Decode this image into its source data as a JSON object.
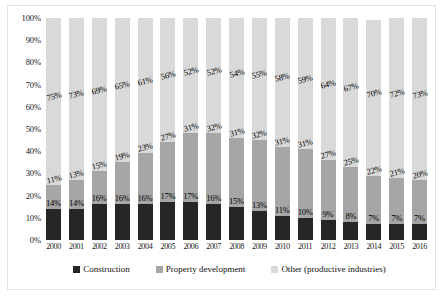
{
  "chart_data": {
    "type": "bar",
    "stacked": true,
    "title": "",
    "xlabel": "",
    "ylabel": "",
    "ylim": [
      0,
      100
    ],
    "grid": false,
    "legend_position": "bottom",
    "categories": [
      "2000",
      "2001",
      "2002",
      "2003",
      "2004",
      "2005",
      "2006",
      "2007",
      "2008",
      "2009",
      "2010",
      "2011",
      "2012",
      "2013",
      "2014",
      "2015",
      "2016"
    ],
    "ytick_labels": [
      "100%",
      "90%",
      "80%",
      "70%",
      "60%",
      "50%",
      "40%",
      "30%",
      "20%",
      "10%",
      "0%"
    ],
    "ytick_values": [
      100,
      90,
      80,
      70,
      60,
      50,
      40,
      30,
      20,
      10,
      0
    ],
    "series": [
      {
        "name": "Construction",
        "color": "#262626",
        "values": [
          14,
          14,
          16,
          16,
          16,
          17,
          17,
          16,
          15,
          13,
          11,
          10,
          9,
          8,
          7,
          7,
          7
        ],
        "labels": [
          "14%",
          "14%",
          "16%",
          "16%",
          "16%",
          "17%",
          "17%",
          "16%",
          "15%",
          "13%",
          "11%",
          "10%",
          "9%",
          "8%",
          "7%",
          "7%",
          "7%"
        ]
      },
      {
        "name": "Property development",
        "color": "#a6a6a6",
        "values": [
          11,
          13,
          15,
          19,
          23,
          27,
          31,
          32,
          31,
          32,
          31,
          31,
          27,
          25,
          22,
          21,
          20
        ],
        "labels": [
          "11%",
          "13%",
          "15%",
          "19%",
          "23%",
          "27%",
          "31%",
          "32%",
          "31%",
          "32%",
          "31%",
          "31%",
          "27%",
          "25%",
          "22%",
          "21%",
          "20%"
        ]
      },
      {
        "name": "Other (productive industries)",
        "color": "#d9d9d9",
        "values": [
          75,
          73,
          69,
          65,
          61,
          56,
          52,
          52,
          54,
          55,
          58,
          59,
          64,
          67,
          70,
          72,
          73
        ],
        "labels": [
          "75%",
          "73%",
          "69%",
          "65%",
          "61%",
          "56%",
          "52%",
          "52%",
          "54%",
          "55%",
          "58%",
          "59%",
          "64%",
          "67%",
          "70%",
          "72%",
          "73%"
        ]
      }
    ]
  }
}
